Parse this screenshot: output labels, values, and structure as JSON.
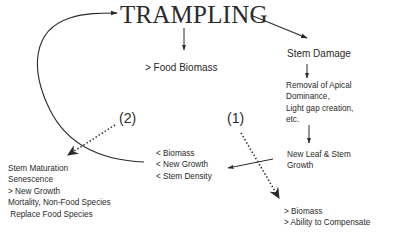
{
  "diagram": {
    "title": "TRAMPLING",
    "nodes": {
      "food_biomass": {
        "text": "> Food Biomass"
      },
      "stem_damage": {
        "text": "Stem Damage"
      },
      "removal": {
        "lines": [
          "Removal of Apical",
          "Dominance,",
          "Light gap creation,",
          "etc."
        ]
      },
      "new_leaf": {
        "lines": [
          "New Leaf & Stem",
          "Growth"
        ]
      },
      "less_effects": {
        "lines": [
          "< Biomass",
          "< New Growth",
          "< Stem Density"
        ]
      },
      "outcome_2": {
        "lines": [
          "Stem Maturation",
          "Senescence",
          "> New Growth",
          "Mortality, Non-Food Species",
          " Replace Food Species"
        ]
      },
      "outcome_1": {
        "lines": [
          "> Biomass",
          "> Ability to Compensate"
        ]
      }
    },
    "path_labels": {
      "path1": "(1)",
      "path2": "(2)"
    },
    "edges": [
      {
        "from": "TRAMPLING",
        "to": "> Food Biomass",
        "style": "solid"
      },
      {
        "from": "TRAMPLING",
        "to": "Stem Damage",
        "style": "solid"
      },
      {
        "from": "Stem Damage",
        "to": "Removal of Apical Dominance, Light gap creation, etc.",
        "style": "solid"
      },
      {
        "from": "Removal of Apical Dominance, Light gap creation, etc.",
        "to": "New Leaf & Stem Growth",
        "style": "solid"
      },
      {
        "from": "New Leaf & Stem Growth",
        "to": "< Biomass / < New Growth / < Stem Density",
        "style": "solid"
      },
      {
        "from": "< Biomass / < New Growth / < Stem Density",
        "to": "TRAMPLING",
        "style": "solid-curved"
      },
      {
        "from": "(1)",
        "to": "> Biomass / > Ability to Compensate",
        "style": "dotted"
      },
      {
        "from": "(2)",
        "to": "Stem Maturation / Senescence / > New Growth / Mortality, Non-Food Species Replace Food Species",
        "style": "dotted"
      }
    ],
    "colors": {
      "ink": "#2a2a2a",
      "background": "#ffffff"
    }
  }
}
